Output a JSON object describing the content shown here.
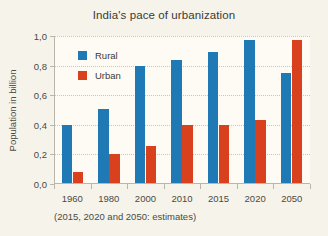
{
  "chart_data": {
    "type": "bar",
    "title": "India's pace of urbanization",
    "xlabel": "",
    "ylabel": "Population in billion",
    "categories": [
      "1960",
      "1980",
      "2000",
      "2010",
      "2015",
      "2020",
      "2050"
    ],
    "series": [
      {
        "name": "Rural",
        "color": "#1f79b5",
        "values": [
          0.4,
          0.51,
          0.8,
          0.84,
          0.89,
          0.97,
          0.75
        ]
      },
      {
        "name": "Urban",
        "color": "#d8401e",
        "values": [
          0.08,
          0.2,
          0.26,
          0.4,
          0.4,
          0.43,
          0.97
        ]
      }
    ],
    "ylim": [
      0.0,
      1.0
    ],
    "yticks": [
      0.0,
      0.2,
      0.4,
      0.6,
      0.8,
      1.0
    ],
    "ytick_labels": [
      "0,0",
      "0,2",
      "0,4",
      "0,6",
      "0,8",
      "1,0"
    ],
    "grid": true,
    "legend_position": "upper-left-inside",
    "annotation": "(2015, 2020 and 2050: estimates)"
  },
  "figure": {
    "background_color": "#f6f3ea",
    "plot_background_color": "#fdfbf4",
    "grid_color": "#c9c6bb",
    "axis_color": "#b9b6ac",
    "text_color": "#3a3a38"
  }
}
